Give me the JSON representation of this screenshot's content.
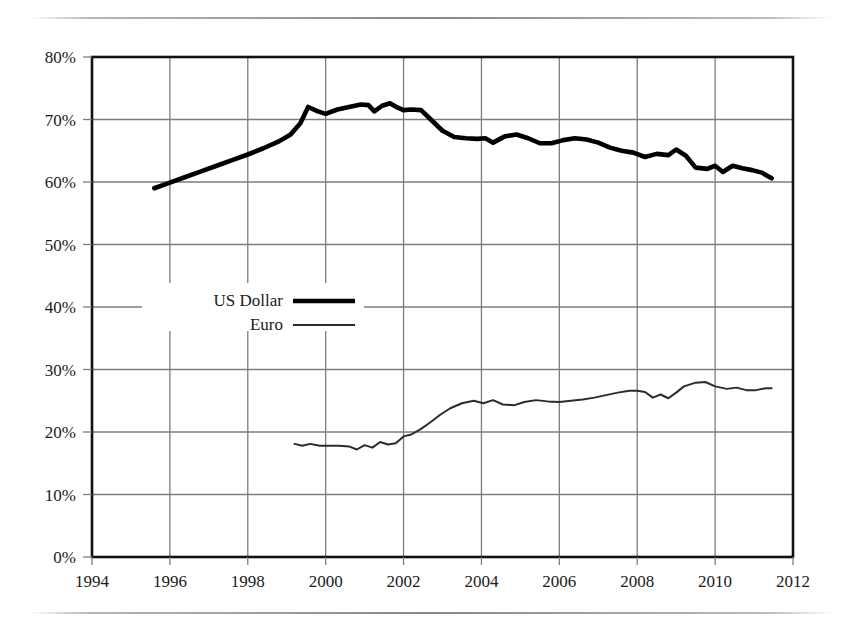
{
  "chart_data": {
    "type": "line",
    "title": "",
    "xlabel": "",
    "ylabel": "",
    "xlim": [
      1994,
      2012
    ],
    "ylim": [
      0,
      80
    ],
    "grid": true,
    "legend_position": "inside-left",
    "x_tick_labels": [
      "1994",
      "1996",
      "1998",
      "2000",
      "2002",
      "2004",
      "2006",
      "2008",
      "2010",
      "2012"
    ],
    "x_ticks": [
      1994,
      1996,
      1998,
      2000,
      2002,
      2004,
      2006,
      2008,
      2010,
      2012
    ],
    "y_tick_labels": [
      "0%",
      "10%",
      "20%",
      "30%",
      "40%",
      "50%",
      "60%",
      "70%",
      "80%"
    ],
    "y_ticks": [
      0,
      10,
      20,
      30,
      40,
      50,
      60,
      70,
      80
    ],
    "y_unit": "%",
    "series": [
      {
        "name": "US Dollar",
        "style": "thick",
        "color": "#000000",
        "line_width": 4.6,
        "points": [
          [
            1995.6,
            59.0
          ],
          [
            1996.0,
            59.9
          ],
          [
            1996.4,
            60.8
          ],
          [
            1996.8,
            61.7
          ],
          [
            1997.2,
            62.6
          ],
          [
            1997.6,
            63.5
          ],
          [
            1998.0,
            64.4
          ],
          [
            1998.4,
            65.4
          ],
          [
            1998.8,
            66.5
          ],
          [
            1999.1,
            67.6
          ],
          [
            1999.35,
            69.4
          ],
          [
            1999.55,
            72.0
          ],
          [
            1999.8,
            71.3
          ],
          [
            2000.0,
            70.9
          ],
          [
            2000.3,
            71.6
          ],
          [
            2000.6,
            72.0
          ],
          [
            2000.9,
            72.4
          ],
          [
            2001.1,
            72.3
          ],
          [
            2001.25,
            71.3
          ],
          [
            2001.45,
            72.2
          ],
          [
            2001.65,
            72.6
          ],
          [
            2001.85,
            71.9
          ],
          [
            2002.0,
            71.5
          ],
          [
            2002.2,
            71.6
          ],
          [
            2002.45,
            71.5
          ],
          [
            2002.7,
            70.0
          ],
          [
            2003.0,
            68.2
          ],
          [
            2003.3,
            67.2
          ],
          [
            2003.6,
            67.0
          ],
          [
            2003.9,
            66.9
          ],
          [
            2004.1,
            67.0
          ],
          [
            2004.3,
            66.3
          ],
          [
            2004.6,
            67.3
          ],
          [
            2004.9,
            67.6
          ],
          [
            2005.2,
            67.0
          ],
          [
            2005.5,
            66.2
          ],
          [
            2005.8,
            66.2
          ],
          [
            2006.1,
            66.7
          ],
          [
            2006.4,
            67.0
          ],
          [
            2006.7,
            66.8
          ],
          [
            2007.0,
            66.3
          ],
          [
            2007.3,
            65.5
          ],
          [
            2007.6,
            65.0
          ],
          [
            2007.9,
            64.7
          ],
          [
            2008.2,
            64.0
          ],
          [
            2008.5,
            64.5
          ],
          [
            2008.8,
            64.3
          ],
          [
            2009.0,
            65.2
          ],
          [
            2009.25,
            64.2
          ],
          [
            2009.5,
            62.3
          ],
          [
            2009.8,
            62.1
          ],
          [
            2010.0,
            62.6
          ],
          [
            2010.2,
            61.6
          ],
          [
            2010.45,
            62.6
          ],
          [
            2010.7,
            62.2
          ],
          [
            2010.95,
            61.9
          ],
          [
            2011.2,
            61.5
          ],
          [
            2011.45,
            60.6
          ]
        ]
      },
      {
        "name": "Euro",
        "style": "thin",
        "color": "#2b2b2b",
        "line_width": 2.0,
        "points": [
          [
            1999.2,
            18.1
          ],
          [
            1999.4,
            17.8
          ],
          [
            1999.6,
            18.1
          ],
          [
            1999.85,
            17.8
          ],
          [
            2000.1,
            17.8
          ],
          [
            2000.35,
            17.8
          ],
          [
            2000.6,
            17.7
          ],
          [
            2000.8,
            17.2
          ],
          [
            2001.0,
            17.9
          ],
          [
            2001.2,
            17.5
          ],
          [
            2001.4,
            18.4
          ],
          [
            2001.6,
            18.0
          ],
          [
            2001.8,
            18.2
          ],
          [
            2002.0,
            19.3
          ],
          [
            2002.2,
            19.6
          ],
          [
            2002.45,
            20.5
          ],
          [
            2002.7,
            21.6
          ],
          [
            2002.95,
            22.8
          ],
          [
            2003.2,
            23.8
          ],
          [
            2003.5,
            24.6
          ],
          [
            2003.8,
            25.0
          ],
          [
            2004.05,
            24.6
          ],
          [
            2004.3,
            25.1
          ],
          [
            2004.55,
            24.4
          ],
          [
            2004.85,
            24.3
          ],
          [
            2005.1,
            24.8
          ],
          [
            2005.4,
            25.1
          ],
          [
            2005.7,
            24.9
          ],
          [
            2006.0,
            24.8
          ],
          [
            2006.3,
            25.0
          ],
          [
            2006.6,
            25.2
          ],
          [
            2006.9,
            25.5
          ],
          [
            2007.2,
            25.9
          ],
          [
            2007.5,
            26.3
          ],
          [
            2007.8,
            26.6
          ],
          [
            2008.0,
            26.6
          ],
          [
            2008.2,
            26.4
          ],
          [
            2008.4,
            25.5
          ],
          [
            2008.6,
            26.0
          ],
          [
            2008.8,
            25.4
          ],
          [
            2009.0,
            26.3
          ],
          [
            2009.2,
            27.3
          ],
          [
            2009.5,
            27.9
          ],
          [
            2009.75,
            28.0
          ],
          [
            2010.0,
            27.3
          ],
          [
            2010.3,
            26.9
          ],
          [
            2010.55,
            27.1
          ],
          [
            2010.8,
            26.7
          ],
          [
            2011.05,
            26.7
          ],
          [
            2011.3,
            27.0
          ],
          [
            2011.45,
            27.0
          ]
        ]
      }
    ],
    "legend": [
      {
        "label": "US Dollar",
        "style": "thick"
      },
      {
        "label": "Euro",
        "style": "thin"
      }
    ]
  },
  "colors": {
    "axis": "#111111",
    "grid": "#7d7d7d",
    "background": "#ffffff",
    "usd_line": "#000000",
    "euro_line": "#2b2b2b"
  }
}
